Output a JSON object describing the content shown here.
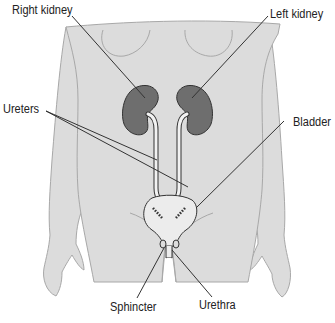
{
  "diagram": {
    "colors": {
      "body_fill": "#dcdcdc",
      "body_stroke": "#a8a8a8",
      "kidney_fill": "#6e6e6e",
      "kidney_stroke": "#333333",
      "bladder_fill": "#ececec",
      "leader_line": "#333333",
      "text": "#222222"
    },
    "labels": {
      "right_kidney": "Right kidney",
      "left_kidney": "Left kidney",
      "ureters": "Ureters",
      "bladder": "Bladder",
      "sphincter": "Sphincter",
      "urethra": "Urethra"
    }
  }
}
